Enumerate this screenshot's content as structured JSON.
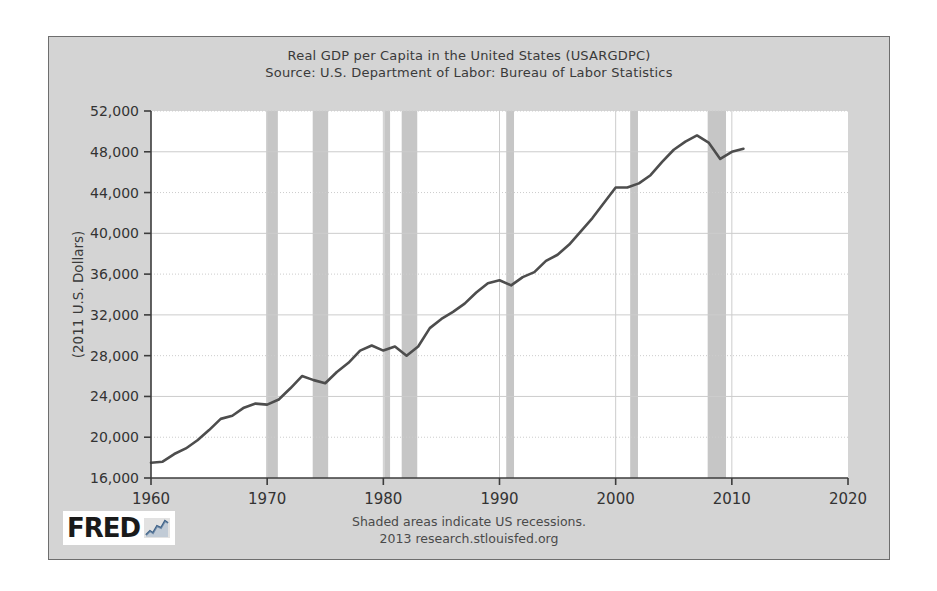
{
  "chart_data": {
    "type": "line",
    "title": "Real GDP per Capita in the United States (USARGDPC)",
    "subtitle": "Source: U.S. Department of Labor: Bureau of Labor Statistics",
    "xlabel": "",
    "ylabel": "(2011 U.S. Dollars)",
    "xlim": [
      1960,
      2020
    ],
    "ylim": [
      16000,
      52000
    ],
    "xticks": [
      1960,
      1970,
      1980,
      1990,
      2000,
      2010,
      2020
    ],
    "xtick_labels": [
      "1960",
      "1970",
      "1980",
      "1990",
      "2000",
      "2010",
      "2020"
    ],
    "yticks": [
      16000,
      20000,
      24000,
      28000,
      32000,
      36000,
      40000,
      44000,
      48000,
      52000
    ],
    "ytick_labels": [
      "16,000",
      "20,000",
      "24,000",
      "28,000",
      "32,000",
      "36,000",
      "40,000",
      "44,000",
      "48,000",
      "52,000"
    ],
    "grid": true,
    "legend": "none",
    "series": [
      {
        "name": "Real GDP per Capita",
        "color": "#4d4d4d",
        "x": [
          1960,
          1961,
          1962,
          1963,
          1964,
          1965,
          1966,
          1967,
          1968,
          1969,
          1970,
          1971,
          1972,
          1973,
          1974,
          1975,
          1976,
          1977,
          1978,
          1979,
          1980,
          1981,
          1982,
          1983,
          1984,
          1985,
          1986,
          1987,
          1988,
          1989,
          1990,
          1991,
          1992,
          1993,
          1994,
          1995,
          1996,
          1997,
          1998,
          1999,
          2000,
          2001,
          2002,
          2003,
          2004,
          2005,
          2006,
          2007,
          2008,
          2009,
          2010,
          2011
        ],
        "values": [
          17500,
          17600,
          18350,
          18900,
          19700,
          20700,
          21800,
          22100,
          22900,
          23300,
          23200,
          23700,
          24800,
          26000,
          25600,
          25300,
          26400,
          27300,
          28500,
          29000,
          28500,
          28900,
          28000,
          28900,
          30700,
          31600,
          32300,
          33100,
          34200,
          35100,
          35400,
          34900,
          35700,
          36200,
          37300,
          37900,
          38900,
          40200,
          41500,
          43000,
          44500,
          44500,
          44900,
          45700,
          47000,
          48200,
          49000,
          49600,
          48900,
          47300,
          48000,
          48300
        ]
      }
    ],
    "recessions": [
      {
        "label": "1970 recession",
        "start": 1969.92,
        "end": 1970.92
      },
      {
        "label": "1973-75 recession",
        "start": 1973.92,
        "end": 1975.25
      },
      {
        "label": "1980 recession",
        "start": 1980.08,
        "end": 1980.58
      },
      {
        "label": "1981-82 recession",
        "start": 1981.58,
        "end": 1982.92
      },
      {
        "label": "1990-91 recession",
        "start": 1990.58,
        "end": 1991.25
      },
      {
        "label": "2001 recession",
        "start": 2001.25,
        "end": 2001.92
      },
      {
        "label": "2007-09 recession",
        "start": 2007.92,
        "end": 2009.5
      }
    ],
    "recession_color": "#c6c6c6",
    "plot_background": "#ffffff",
    "figure_background": "#d4d4d4",
    "axis_color": "#3c3c3c",
    "grid_color": "#cccccc"
  },
  "footer": {
    "line1": "Shaded areas indicate US recessions.",
    "line2": "2013 research.stlouisfed.org"
  },
  "logo": {
    "wordmark": "FRED",
    "mark_icon": "line-chart-icon"
  }
}
